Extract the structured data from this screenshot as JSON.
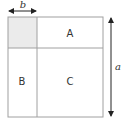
{
  "diagram": {
    "labels": {
      "top_width": "b",
      "right_height": "a",
      "region_top_right": "A",
      "region_bottom_left": "B",
      "region_bottom_right": "C"
    },
    "colors": {
      "line": "#a0a0a0",
      "shaded": "#ebebeb",
      "arrow": "#222222",
      "text": "#333333"
    },
    "geometry": {
      "square": {
        "x": 8,
        "y": 17,
        "width": 95,
        "height": 100
      },
      "divider_x": 37,
      "divider_y": 48
    }
  }
}
